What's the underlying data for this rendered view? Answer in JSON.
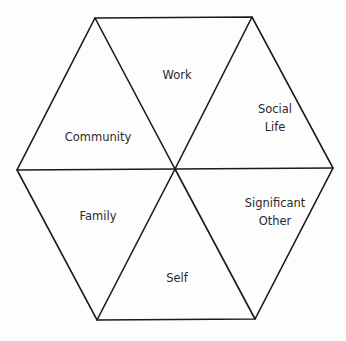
{
  "diagram": {
    "type": "hexagon-wheel",
    "segments": [
      {
        "id": "work",
        "lines": [
          "Work"
        ]
      },
      {
        "id": "social-life",
        "lines": [
          "Social",
          "Life"
        ]
      },
      {
        "id": "significant-other",
        "lines": [
          "Significant",
          "Other"
        ]
      },
      {
        "id": "self",
        "lines": [
          "Self"
        ]
      },
      {
        "id": "family",
        "lines": [
          "Family"
        ]
      },
      {
        "id": "community",
        "lines": [
          "Community"
        ]
      }
    ],
    "colors": {
      "stroke": "#1a1a1a",
      "text": "#2a2a2a",
      "background": "#fdfdfd"
    }
  }
}
